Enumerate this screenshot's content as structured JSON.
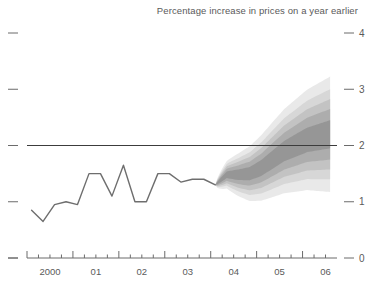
{
  "chart_data": {
    "type": "area",
    "title": "Percentage increase in prices on a year earlier",
    "subtitle": "",
    "xlabel": "",
    "ylabel": "",
    "ylim": [
      0,
      4
    ],
    "xlim": [
      1999.5,
      2006.25
    ],
    "grid": false,
    "legend": "none",
    "y_ticks": [
      "0",
      "1",
      "2",
      "3",
      "4"
    ],
    "y_tick_values": [
      0,
      1,
      2,
      3,
      4
    ],
    "y_axis_side": "right",
    "x_ticks": [
      "2000",
      "01",
      "02",
      "03",
      "04",
      "05",
      "06"
    ],
    "x_tick_values": [
      2000,
      2001,
      2002,
      2003,
      2004,
      2005,
      2006
    ],
    "x_minor_ticks_per_year": 4,
    "target_line": {
      "label": "2% inflation target",
      "value": 2.0,
      "color": "#3c3c3c"
    },
    "series": [
      {
        "name": "Historical inflation (outturn)",
        "type": "line",
        "color": "#6e6e6e",
        "x": [
          1999.6,
          1999.85,
          2000.1,
          2000.35,
          2000.6,
          2000.85,
          2001.1,
          2001.35,
          2001.6,
          2001.85,
          2002.1,
          2002.35,
          2002.6,
          2002.85,
          2003.1,
          2003.35,
          2003.6
        ],
        "values": [
          0.85,
          0.65,
          0.95,
          1.0,
          0.95,
          1.5,
          1.5,
          1.1,
          1.65,
          1.0,
          1.0,
          1.5,
          1.5,
          1.35,
          1.4,
          1.4,
          1.3
        ]
      },
      {
        "name": "Forecast fan (central projection)",
        "type": "line",
        "color": "#8a8a8a",
        "x": [
          2003.6,
          2003.85,
          2004.1,
          2004.35,
          2004.6,
          2004.85,
          2005.1,
          2005.35,
          2005.6,
          2005.85,
          2006.1
        ],
        "values": [
          1.3,
          1.48,
          1.48,
          1.5,
          1.6,
          1.75,
          1.9,
          2.0,
          2.1,
          2.15,
          2.2
        ]
      }
    ],
    "fan_bands": {
      "description": "Probability distribution fan, darkest at centre, fading outward",
      "start_x": 2003.6,
      "end_x": 2006.1,
      "bands": [
        {
          "percentile": 10,
          "lower_end": 1.95,
          "upper_end": 2.45,
          "shade": "#8f8f8f"
        },
        {
          "percentile": 30,
          "lower_end": 1.75,
          "upper_end": 2.65,
          "shade": "#a5a5a5"
        },
        {
          "percentile": 50,
          "lower_end": 1.55,
          "upper_end": 2.8,
          "shade": "#bcbcbc"
        },
        {
          "percentile": 70,
          "lower_end": 1.35,
          "upper_end": 2.95,
          "shade": "#d0d0d0"
        },
        {
          "percentile": 90,
          "lower_end": 1.1,
          "upper_end": 3.15,
          "shade": "#e2e2e2"
        }
      ]
    }
  }
}
